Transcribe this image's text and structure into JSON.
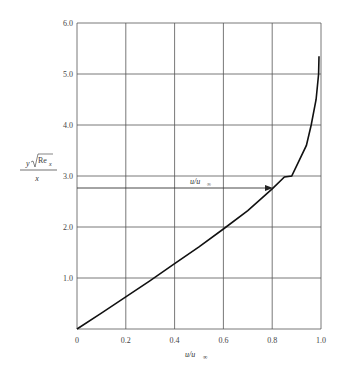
{
  "chart_data": {
    "type": "line",
    "title": "",
    "xlabel": "u/u∞",
    "ylabel": "y√Re_x / x",
    "xlim": [
      0,
      1.0
    ],
    "ylim": [
      0,
      6.0
    ],
    "grid": true,
    "x_ticks": [
      "0",
      "0.2",
      "0.4",
      "0.6",
      "0.8",
      "1.0"
    ],
    "y_ticks": [
      "1.0",
      "2.0",
      "3.0",
      "4.0",
      "5.0",
      "6.0"
    ],
    "series": [
      {
        "name": "Blasius velocity profile",
        "x": [
          0,
          0.1,
          0.2,
          0.3,
          0.4,
          0.5,
          0.6,
          0.7,
          0.8,
          0.85,
          0.88,
          0.9,
          0.94,
          0.96,
          0.98,
          0.99,
          0.992
        ],
        "y": [
          0,
          0.31,
          0.63,
          0.95,
          1.28,
          1.61,
          1.96,
          2.32,
          2.75,
          2.98,
          3.0,
          3.2,
          3.6,
          4.0,
          4.5,
          5.0,
          5.35
        ]
      }
    ],
    "annotations": [
      {
        "text": "u/u∞",
        "type": "arrow",
        "from": [
          0,
          2.75
        ],
        "to": [
          0.8,
          2.75
        ]
      }
    ]
  },
  "labels": {
    "origin": "0",
    "ylabel_numerator_y": "y",
    "ylabel_numerator_re": "Re",
    "ylabel_numerator_sub": "x",
    "ylabel_denominator": "x",
    "xlabel_main": "u/u",
    "xlabel_sub": "∞",
    "annotation_main": "u/u",
    "annotation_sub": "∞"
  }
}
